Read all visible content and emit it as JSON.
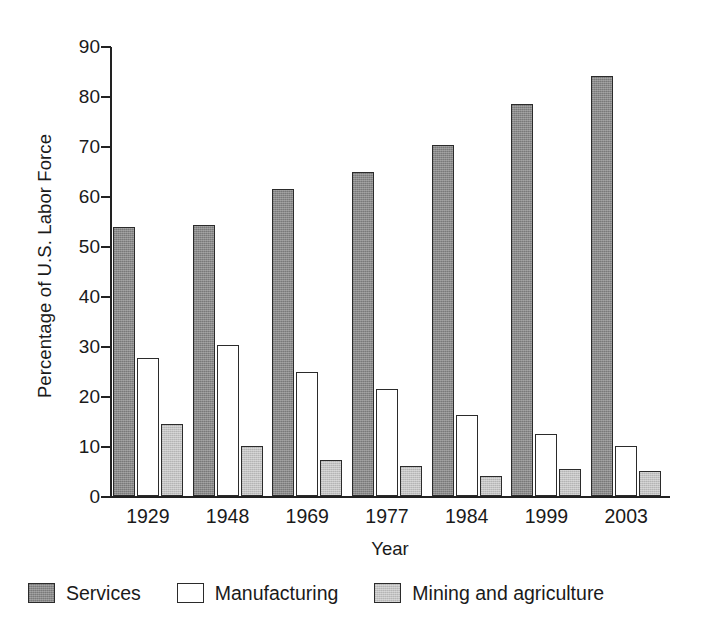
{
  "chart_data": {
    "type": "bar",
    "title": "",
    "xlabel": "Year",
    "ylabel": "Percentage of U.S. Labor Force",
    "categories": [
      "1929",
      "1948",
      "1969",
      "1977",
      "1984",
      "1999",
      "2003"
    ],
    "series": [
      {
        "name": "Services",
        "color": "#8a8a8a",
        "values": [
          53.8,
          54.2,
          61.4,
          64.8,
          70.2,
          78.4,
          84.0
        ]
      },
      {
        "name": "Manufacturing",
        "color": "#ffffff",
        "values": [
          27.6,
          30.2,
          24.8,
          21.4,
          16.2,
          12.4,
          10.0
        ]
      },
      {
        "name": "Mining and agriculture",
        "color": "#c2c2c2",
        "values": [
          14.4,
          10.0,
          7.2,
          6.0,
          4.0,
          5.4,
          5.0
        ]
      }
    ],
    "ylim": [
      0,
      90
    ],
    "ytick_labels": [
      "0",
      "10",
      "20",
      "30",
      "40",
      "50",
      "60",
      "70",
      "80",
      "90"
    ],
    "ytick_values": [
      0,
      10,
      20,
      30,
      40,
      50,
      60,
      70,
      80,
      90
    ],
    "grid": false,
    "legend_position": "bottom",
    "legend": [
      "Services",
      "Manufacturing",
      "Mining and agriculture"
    ]
  }
}
